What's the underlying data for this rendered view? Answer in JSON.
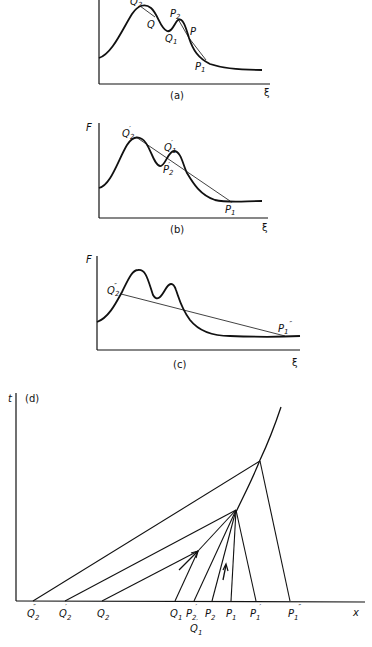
{
  "panels": {
    "a": {
      "caption": "(a)",
      "y_axis_label": "",
      "x_axis_label": "ξ",
      "points": [
        "Q2",
        "Q",
        "P2",
        "Q1",
        "P",
        "P1"
      ],
      "labels": {
        "Q2": "Q",
        "Q2_sub": "2",
        "Q": "Q",
        "P2": "P",
        "P2_sub": "2",
        "Q1": "Q",
        "Q1_sub": "1",
        "P": "P",
        "P1": "P",
        "P1_sub": "1"
      }
    },
    "b": {
      "caption": "(b)",
      "y_axis_label": "F",
      "x_axis_label": "ξ",
      "labels": {
        "Q2p": "Q",
        "Q2p_sub": "2",
        "Q1p": "Q",
        "Q1p_sub": "1",
        "P2p": "P",
        "P2p_sub": "2",
        "P1p": "P",
        "P1p_sub": "1",
        "prime": "′"
      }
    },
    "c": {
      "caption": "(c)",
      "y_axis_label": "F",
      "x_axis_label": "ξ",
      "labels": {
        "Q2pp": "Q",
        "Q2pp_sub": "2",
        "P1pp": "P",
        "P1pp_sub": "1",
        "dprime": "″"
      }
    },
    "d": {
      "caption": "(d)",
      "y_axis_label": "t",
      "x_axis_label": "x",
      "axis_points": [
        {
          "name": "Q",
          "sub": "2",
          "mark": "″"
        },
        {
          "name": "Q",
          "sub": "2",
          "mark": "′"
        },
        {
          "name": "Q",
          "sub": "2",
          "mark": ""
        },
        {
          "name": "Q",
          "sub": "1",
          "mark": ""
        },
        {
          "name": "P",
          "sub": "2",
          "mark": "′"
        },
        {
          "name": "P",
          "sub": "2",
          "mark": ""
        },
        {
          "name": "P",
          "sub": "1",
          "mark": ""
        },
        {
          "name": "P",
          "sub": "1",
          "mark": "′"
        },
        {
          "name": "P",
          "sub": "1",
          "mark": "″"
        }
      ],
      "below_label": {
        "name": "Q",
        "sub": "1",
        "mark": "′"
      }
    }
  },
  "colors": {
    "ink": "#111111",
    "background": "#ffffff"
  }
}
